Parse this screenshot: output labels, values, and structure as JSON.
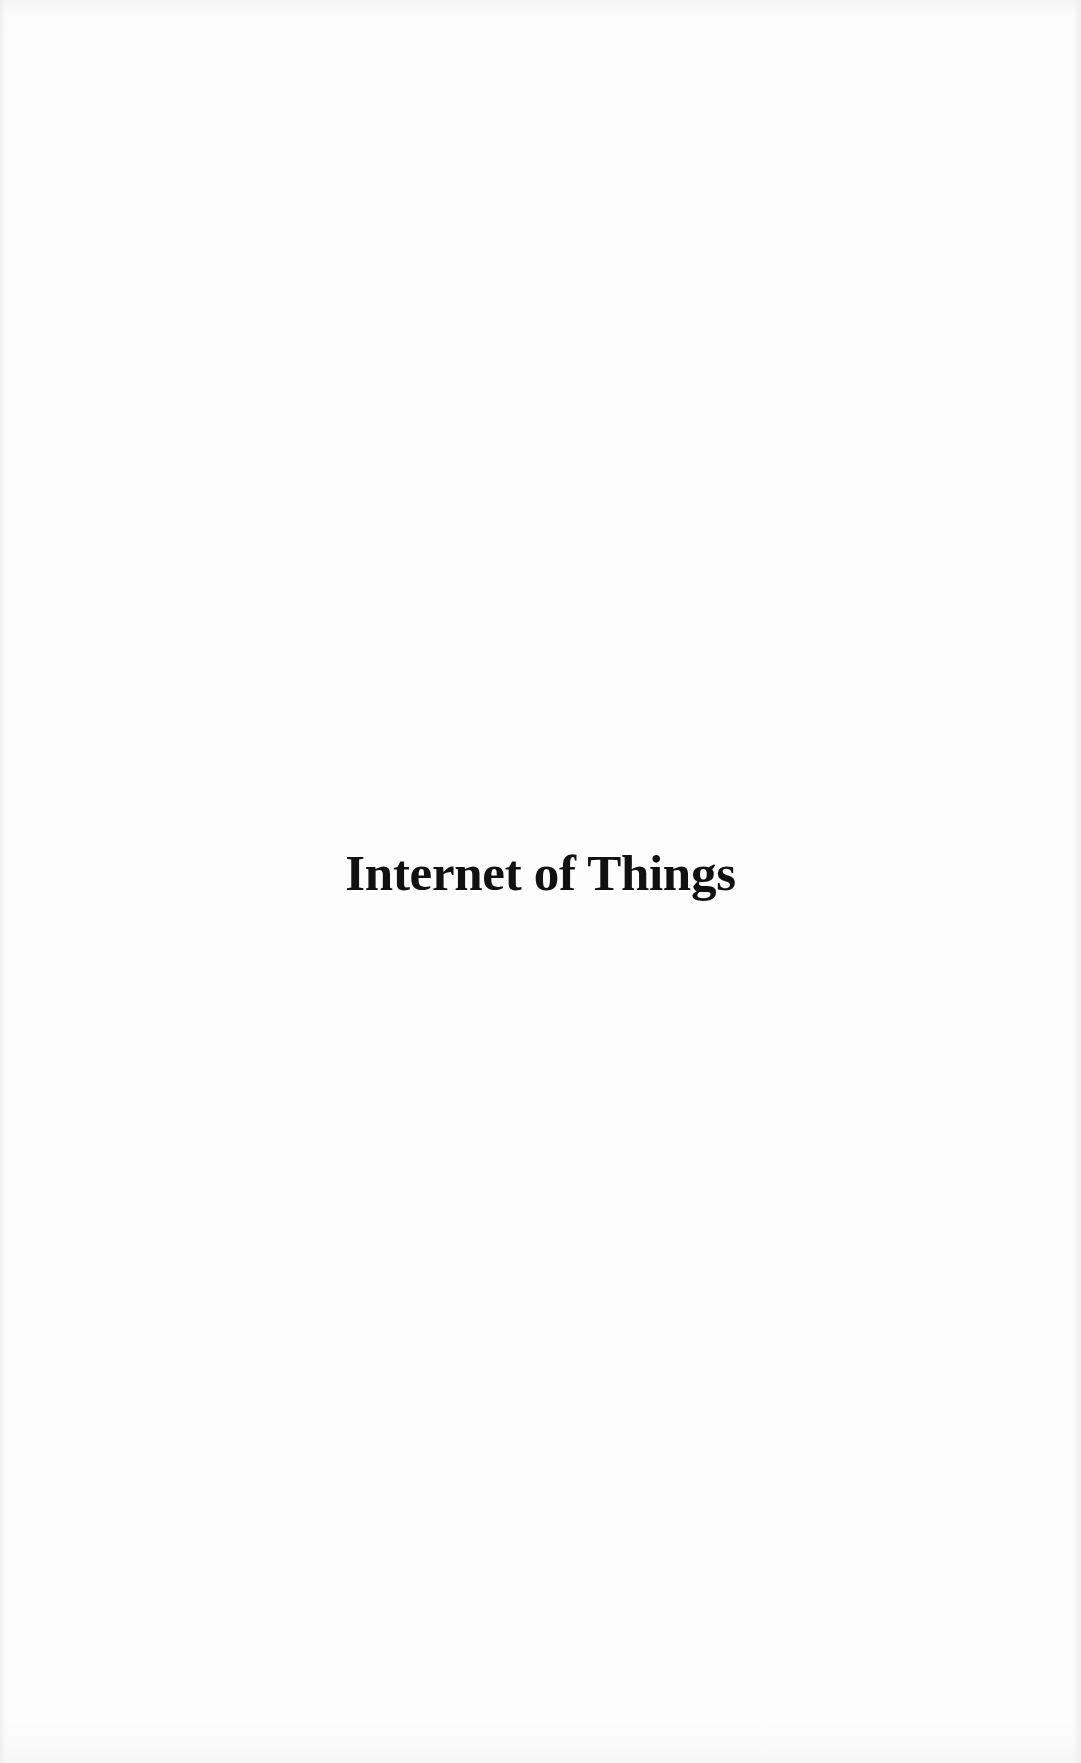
{
  "page": {
    "title": "Internet of Things",
    "colors": {
      "background": "#fdfdfd",
      "text": "#111111"
    }
  }
}
